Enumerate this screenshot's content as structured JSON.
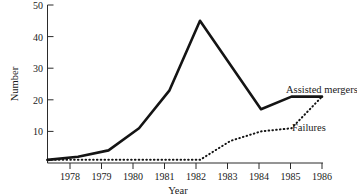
{
  "chart_data": {
    "type": "line",
    "title": "",
    "xlabel": "Year",
    "ylabel": "Number",
    "xlim": [
      1977,
      1986
    ],
    "ylim": [
      0,
      50
    ],
    "grid": false,
    "legend_position": "inline-right",
    "x": [
      1977,
      1978,
      1979,
      1980,
      1981,
      1982,
      1983,
      1984,
      1985,
      1986
    ],
    "xtick_labels": [
      "1978",
      "1979",
      "1980",
      "1981",
      "1982",
      "1983",
      "1984",
      "1985",
      "1986"
    ],
    "xticks": [
      1978,
      1979,
      1980,
      1981,
      1982,
      1983,
      1984,
      1985,
      1986
    ],
    "ytick_labels": [
      "10",
      "20",
      "30",
      "40",
      "50"
    ],
    "yticks": [
      10,
      20,
      30,
      40,
      50
    ],
    "series": [
      {
        "name": "Assisted mergers",
        "style": "solid",
        "values": [
          1,
          2,
          4,
          11,
          23,
          45,
          31,
          17,
          21,
          21
        ]
      },
      {
        "name": "Failures",
        "style": "dotted",
        "values": [
          1,
          1,
          1,
          1,
          1,
          1,
          7,
          10,
          11,
          21
        ]
      }
    ]
  },
  "labels": {
    "y_axis": "Number",
    "x_axis": "Year",
    "series_assisted_mergers": "Assisted mergers",
    "series_failures": "Failures"
  },
  "colors": {
    "line": "#141414",
    "axis": "#2b2b2b",
    "background": "#ffffff"
  }
}
